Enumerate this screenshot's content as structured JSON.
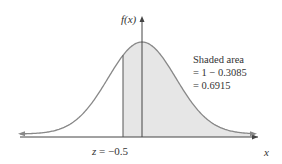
{
  "chart_data": {
    "type": "area",
    "title": "",
    "distribution": "standard normal",
    "xlabel": "x",
    "ylabel": "f(x)",
    "shaded_region": {
      "from_z": -0.5,
      "to_z": "inf"
    },
    "z_marker": {
      "value": -0.5,
      "label_prefix": "z",
      "label_text": " = −0.5"
    },
    "annotation": {
      "lines": [
        "Shaded area",
        "= 1 − 0.3085",
        "= 0.6915"
      ]
    },
    "values": {
      "left_tail_area": 0.3085,
      "shaded_area": 0.6915
    },
    "grid": false,
    "legend": null
  },
  "colors": {
    "curve": "#888888",
    "shade": "#e6e6e6",
    "axis": "#444444",
    "text": "#333333"
  },
  "labels": {
    "y_axis": "f(x)",
    "x_axis": "x",
    "z_prefix": "z",
    "z_value": " = −0.5",
    "annotation_1": "Shaded area",
    "annotation_2": "= 1 − 0.3085",
    "annotation_3": "= 0.6915"
  }
}
